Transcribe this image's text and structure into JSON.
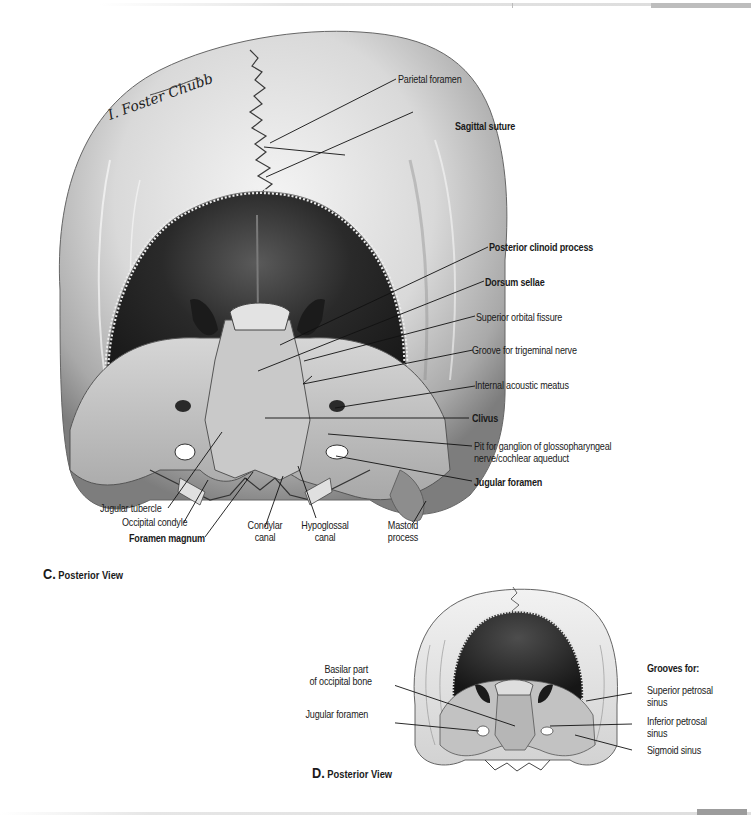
{
  "page": {
    "accent_gray": "#bdbdbd"
  },
  "figure_c": {
    "caption_letter": "C.",
    "caption_text": "Posterior View",
    "signature": "I. Foster Chubb",
    "labels": {
      "parietal_foramen": "Parietal foramen",
      "sagittal_suture": "Sagittal suture",
      "posterior_clinoid_process": "Posterior clinoid process",
      "dorsum_sellae": "Dorsum sellae",
      "superior_orbital_fissure": "Superior orbital fissure",
      "groove_trigeminal": "Groove for trigeminal nerve",
      "internal_acoustic_meatus": "Internal acoustic meatus",
      "clivus": "Clivus",
      "pit_ganglion_line1": "Pit for ganglion of glossopharyngeal",
      "pit_ganglion_line2": "nerve/cochlear aqueduct",
      "jugular_foramen": "Jugular foramen",
      "jugular_tubercle": "Jugular tubercle",
      "occipital_condyle": "Occipital condyle",
      "foramen_magnum": "Foramen magnum",
      "condylar_canal_line1": "Condylar",
      "condylar_canal_line2": "canal",
      "hypoglossal_canal_line1": "Hypoglossal",
      "hypoglossal_canal_line2": "canal",
      "mastoid_process_line1": "Mastoid",
      "mastoid_process_line2": "process"
    }
  },
  "figure_d": {
    "caption_letter": "D.",
    "caption_text": "Posterior View",
    "labels": {
      "basilar_part_line1": "Basilar part",
      "basilar_part_line2": "of occipital bone",
      "jugular_foramen": "Jugular foramen",
      "grooves_heading": "Grooves for:",
      "superior_petrosal_line1": "Superior petrosal",
      "superior_petrosal_line2": "sinus",
      "inferior_petrosal_line1": "Inferior petrosal",
      "inferior_petrosal_line2": "sinus",
      "sigmoid_sinus": "Sigmoid sinus"
    }
  }
}
